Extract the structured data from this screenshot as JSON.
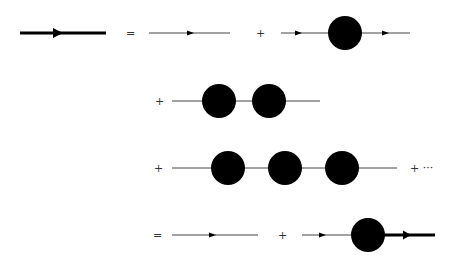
{
  "diagram": {
    "colors": {
      "line": "#000000",
      "thin_line": "#333333",
      "operator": "#333333",
      "background": "#ffffff"
    },
    "rows": [
      {
        "y": 33,
        "items": [
          {
            "type": "thick-propagator",
            "x1": 20,
            "x2": 106,
            "arrow": 57
          },
          {
            "type": "operator",
            "symbol": "=",
            "x": 129
          },
          {
            "type": "thin-propagator",
            "x1": 149,
            "x2": 230,
            "arrow": 190
          },
          {
            "type": "operator",
            "symbol": "+",
            "x": 260
          },
          {
            "type": "thin-propagator",
            "x1": 281,
            "x2": 410,
            "arrows": [
              297,
              385
            ],
            "blobs": [
              345
            ]
          }
        ]
      },
      {
        "y": 101,
        "items": [
          {
            "type": "operator",
            "symbol": "+",
            "x": 159
          },
          {
            "type": "thin-propagator",
            "x1": 172,
            "x2": 320,
            "blobs": [
              219,
              269
            ]
          }
        ]
      },
      {
        "y": 168,
        "items": [
          {
            "type": "operator",
            "symbol": "+",
            "x": 158
          },
          {
            "type": "thin-propagator",
            "x1": 172,
            "x2": 397,
            "blobs": [
              228,
              285,
              342
            ]
          },
          {
            "type": "operator",
            "symbol": "+ ···",
            "x": 414
          }
        ]
      },
      {
        "y": 235,
        "items": [
          {
            "type": "operator",
            "symbol": "=",
            "x": 157
          },
          {
            "type": "thin-propagator",
            "x1": 172,
            "x2": 258,
            "arrow": 212
          },
          {
            "type": "operator",
            "symbol": "+",
            "x": 282
          },
          {
            "type": "mixed-propagator",
            "x1": 302,
            "x2": 435,
            "blob": 368,
            "thin_arrow": 322,
            "thick_arrow": 407
          }
        ]
      }
    ],
    "labels": {
      "op_eq_1": "=",
      "op_plus_1": "+",
      "op_plus_2": "+",
      "op_plus_3": "+",
      "op_plus_dots": "+ ···",
      "op_eq_2": "=",
      "op_plus_4": "+"
    }
  }
}
